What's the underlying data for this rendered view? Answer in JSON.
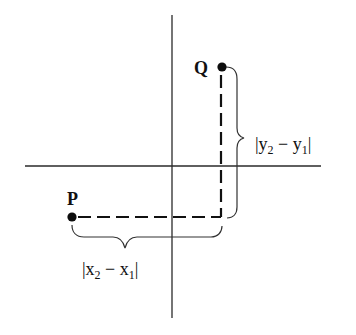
{
  "diagram": {
    "type": "coordinate-distance-diagram",
    "points": [
      {
        "id": "P",
        "label": "P",
        "cx": 72,
        "cy": 217
      },
      {
        "id": "Q",
        "label": "Q",
        "cx": 222,
        "cy": 67
      }
    ],
    "axes": {
      "vertical": {
        "x": 172,
        "y1": 15,
        "y2": 318
      },
      "horizontal": {
        "y": 166,
        "x1": 25,
        "x2": 321
      }
    },
    "labels": {
      "vertical_distance": {
        "open": "|",
        "var1": "y",
        "sub1": "2",
        "minus": " − ",
        "var2": "y",
        "sub2": "1",
        "close": "|"
      },
      "horizontal_distance": {
        "open": "|",
        "var1": "x",
        "sub1": "2",
        "minus": " − ",
        "var2": "x",
        "sub2": "1",
        "close": "|"
      }
    },
    "colors": {
      "ink": "#111111",
      "axis": "#2a2a2a",
      "background": "#ffffff"
    }
  }
}
